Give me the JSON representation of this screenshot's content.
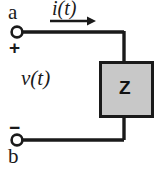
{
  "figure": {
    "name": "one-port-network-impedance-diagram",
    "background_color": "#ffffff",
    "line_color": "#1a1a1a",
    "box_fill_color": "#c8c8c8",
    "box_border_color": "#1a1a1a",
    "width": 161,
    "height": 171
  },
  "labels": {
    "terminal_top": "a",
    "terminal_bottom": "b",
    "polarity_positive": "+",
    "polarity_negative": "−",
    "current": "i(t)",
    "voltage": "v(t)",
    "impedance": "Z"
  },
  "icons": {
    "terminal_top": "open-circle-terminal-icon",
    "terminal_bottom": "open-circle-terminal-icon",
    "current_direction": "right-arrow-icon",
    "impedance_block": "gray-rectangle-icon"
  },
  "geometry": {
    "terminal_top": {
      "cx": 17,
      "cy": 32,
      "r": 5.5
    },
    "terminal_bottom": {
      "cx": 17,
      "cy": 140,
      "r": 5.5
    },
    "top_wire": {
      "x1": 23,
      "y1": 32,
      "x2": 124,
      "y2": 32
    },
    "top_drop": {
      "x1": 124,
      "y1": 32,
      "x2": 124,
      "y2": 62
    },
    "bottom_wire": {
      "x1": 23,
      "y1": 140,
      "x2": 124,
      "y2": 140
    },
    "bottom_rise": {
      "x1": 124,
      "y1": 140,
      "x2": 124,
      "y2": 117
    },
    "impedance_box": {
      "x": 99,
      "y": 61,
      "width": 54,
      "height": 56
    },
    "current_arrow": {
      "x1": 50,
      "y1": 21,
      "x2": 96,
      "y2": 21
    }
  }
}
